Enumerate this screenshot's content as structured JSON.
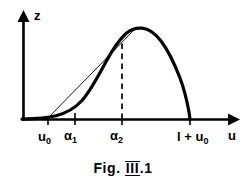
{
  "figure": {
    "caption_prefix": "Fig. ",
    "caption_roman": "III",
    "caption_suffix": ".1",
    "background_color": "#ffffff",
    "ink_color": "#000000"
  },
  "axes": {
    "y_label": "z",
    "x_label": "u",
    "x_tick_labels": [
      "u",
      "α",
      "α",
      "l + u"
    ],
    "ticks": [
      {
        "name": "u0",
        "base": "u",
        "sub": "0",
        "x": 48
      },
      {
        "name": "alpha1",
        "base": "α",
        "sub": "1",
        "x": 75
      },
      {
        "name": "alpha2",
        "base": "α",
        "sub": "2",
        "x": 122
      },
      {
        "name": "l_plus_u0",
        "base": "l + u",
        "sub": "0",
        "x": 190
      }
    ]
  },
  "chart_data": {
    "type": "line",
    "title": "Fig. III.1",
    "xlabel": "u",
    "ylabel": "z",
    "grid": false,
    "legend": null,
    "xlim": [
      20,
      225
    ],
    "ylim": [
      0,
      120
    ],
    "annotations": [
      {
        "label": "u₀",
        "kind": "x-tick",
        "x": 48
      },
      {
        "label": "α₁",
        "kind": "x-tick",
        "x": 75
      },
      {
        "label": "α₂",
        "kind": "x-tick-dashed",
        "x": 122
      },
      {
        "label": "l + u₀",
        "kind": "x-tick",
        "x": 190
      }
    ],
    "series": [
      {
        "name": "z(u) curve",
        "style": "thick-solid",
        "points": [
          [
            22,
            120
          ],
          [
            30,
            119
          ],
          [
            40,
            118
          ],
          [
            48,
            117
          ],
          [
            56,
            115
          ],
          [
            64,
            112
          ],
          [
            72,
            107
          ],
          [
            80,
            99
          ],
          [
            88,
            88
          ],
          [
            96,
            75
          ],
          [
            104,
            61
          ],
          [
            112,
            48
          ],
          [
            120,
            38
          ],
          [
            128,
            32
          ],
          [
            136,
            29
          ],
          [
            144,
            30
          ],
          [
            152,
            34
          ],
          [
            160,
            41
          ],
          [
            168,
            51
          ],
          [
            176,
            66
          ],
          [
            184,
            88
          ],
          [
            189,
            110
          ],
          [
            190,
            120
          ]
        ]
      },
      {
        "name": "chord (tangent line from u0 to peak)",
        "style": "thin-solid",
        "points": [
          [
            48,
            119
          ],
          [
            133,
            30
          ]
        ]
      }
    ],
    "peak": {
      "x": 138,
      "y": 29
    },
    "dashed_vertical": {
      "x": 122,
      "y_top": 36,
      "y_bottom": 119
    }
  }
}
